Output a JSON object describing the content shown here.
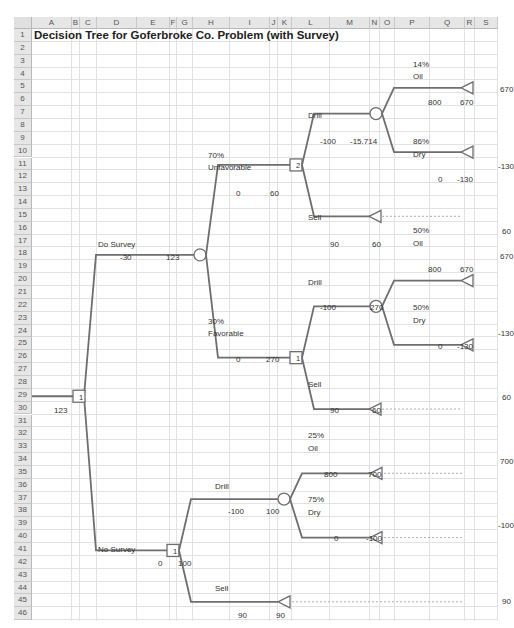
{
  "spreadsheet": {
    "title": "Decision Tree for Goferbroke Co. Problem (with Survey)",
    "columns": [
      "A",
      "B",
      "C",
      "D",
      "E",
      "F",
      "G",
      "H",
      "I",
      "J",
      "K",
      "L",
      "M",
      "N",
      "O",
      "P",
      "Q",
      "R",
      "S"
    ],
    "rows": [
      "1",
      "2",
      "3",
      "4",
      "5",
      "6",
      "7",
      "8",
      "9",
      "10",
      "11",
      "12",
      "13",
      "14",
      "15",
      "16",
      "17",
      "18",
      "19",
      "20",
      "21",
      "22",
      "23",
      "24",
      "25",
      "26",
      "27",
      "28",
      "29",
      "30",
      "31",
      "32",
      "33",
      "34",
      "35",
      "36",
      "37",
      "38",
      "39",
      "40",
      "41",
      "42",
      "43",
      "44",
      "45",
      "46"
    ]
  },
  "tree": {
    "root": {
      "node_type": "decision",
      "node_label": "1",
      "value": "123"
    },
    "do_survey": {
      "label": "Do Survey",
      "cost": "-30",
      "value": "123",
      "unfavorable": {
        "prob": "70%",
        "label": "Unfavorable",
        "cash": "0",
        "value": "60",
        "node_label": "2",
        "drill": {
          "label": "Drill",
          "cost": "-100",
          "value": "-15.714",
          "oil": {
            "prob": "14%",
            "label": "Oil",
            "cash": "800",
            "value": "670",
            "payoff": "670"
          },
          "dry": {
            "prob": "86%",
            "label": "Dry",
            "cash": "0",
            "value": "-130",
            "payoff": "-130"
          }
        },
        "sell": {
          "label": "Sell",
          "cash": "90",
          "value": "60",
          "payoff": "60"
        }
      },
      "favorable": {
        "prob": "30%",
        "label": "Favorable",
        "cash": "0",
        "value": "270",
        "node_label": "1",
        "drill": {
          "label": "Drill",
          "cost": "-100",
          "value": "270",
          "oil": {
            "prob": "50%",
            "label": "Oil",
            "cash": "800",
            "value": "670",
            "payoff": "670"
          },
          "dry": {
            "prob": "50%",
            "label": "Dry",
            "cash": "0",
            "value": "-130",
            "payoff": "-130"
          }
        },
        "sell": {
          "label": "Sell",
          "cash": "90",
          "value": "60",
          "payoff": "60"
        }
      }
    },
    "no_survey": {
      "label": "No Survey",
      "cost": "0",
      "value": "100",
      "node_label": "1",
      "drill": {
        "label": "Drill",
        "cost": "-100",
        "value": "100",
        "oil": {
          "prob": "25%",
          "label": "Oil",
          "cash": "800",
          "value": "700",
          "payoff": "700"
        },
        "dry": {
          "prob": "75%",
          "label": "Dry",
          "cash": "0",
          "value": "-100",
          "payoff": "-100"
        }
      },
      "sell": {
        "label": "Sell",
        "cash": "90",
        "value": "90",
        "payoff": "90"
      }
    }
  },
  "colors": {
    "line": "#6e6e6e",
    "grid": "#e2e2e2",
    "header_bg": "#e6e6e6"
  }
}
